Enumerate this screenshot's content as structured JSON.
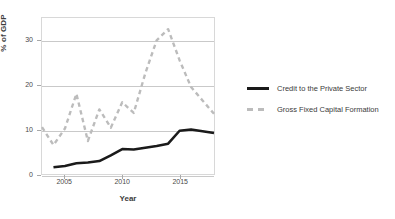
{
  "chart_data": {
    "type": "line",
    "title": "",
    "xlabel": "Year",
    "ylabel": "% of GDP",
    "xlim": [
      2003,
      2018
    ],
    "ylim": [
      0,
      35
    ],
    "xticks": [
      "2005",
      "2010",
      "2015"
    ],
    "xtick_values": [
      2005,
      2010,
      2015
    ],
    "yticks": [
      "0",
      "10",
      "20",
      "30"
    ],
    "ytick_values": [
      0,
      10,
      20,
      30
    ],
    "grid": "horizontal",
    "legend_position": "right",
    "x": [
      2003,
      2004,
      2005,
      2006,
      2007,
      2008,
      2009,
      2010,
      2011,
      2012,
      2013,
      2014,
      2015,
      2016,
      2017,
      2018
    ],
    "series": [
      {
        "name": "Credit to the Private Sector",
        "style": "solid",
        "color": "#1a1a1a",
        "width": 2.6,
        "x": [
          2004,
          2005,
          2006,
          2007,
          2008,
          2009,
          2010,
          2011,
          2012,
          2013,
          2014,
          2015,
          2016,
          2017,
          2018
        ],
        "values": [
          1.5,
          1.8,
          2.4,
          2.6,
          2.9,
          4.2,
          5.6,
          5.5,
          5.9,
          6.3,
          6.8,
          9.7,
          10.0,
          9.6,
          9.2
        ]
      },
      {
        "name": "Gross Fixed Capital Formation",
        "style": "dashed",
        "color": "#bcbcbc",
        "width": 2.4,
        "x": [
          2003,
          2004,
          2005,
          2006,
          2007,
          2008,
          2009,
          2010,
          2011,
          2012,
          2013,
          2014,
          2015,
          2016,
          2017,
          2018
        ],
        "values": [
          10.5,
          6.5,
          10.2,
          18.0,
          7.4,
          14.5,
          10.4,
          16.1,
          13.7,
          22.5,
          30.0,
          32.5,
          25.5,
          19.5,
          16.5,
          13.5
        ]
      }
    ]
  },
  "axes": {
    "y_title": "% of GDP",
    "x_title": "Year"
  },
  "legend": {
    "items": [
      {
        "label": "Credit to the Private Sector",
        "swatch": "solid-line-swatch"
      },
      {
        "label": "Gross Fixed Capital Formation",
        "swatch": "dashed-line-swatch"
      }
    ]
  },
  "colors": {
    "credit_line": "#1a1a1a",
    "gfcf_line": "#bcbcbc",
    "gridline": "#c9c9c9",
    "frame": "#d8d8d8",
    "text": "#3d3d3d"
  }
}
